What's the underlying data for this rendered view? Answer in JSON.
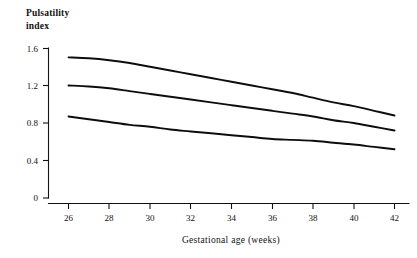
{
  "chart_data": {
    "type": "line",
    "title": "",
    "subtitle": "",
    "xlabel": "Gestational age (weeks)",
    "ylabel": "Pulsatility index",
    "ylabel_line1": "Pulsatility",
    "ylabel_line2": "index",
    "xlim": [
      26,
      42
    ],
    "ylim": [
      0,
      1.6
    ],
    "xticks": [
      26,
      28,
      30,
      32,
      34,
      36,
      38,
      40,
      42
    ],
    "xtick_labels": [
      "26",
      "28",
      "30",
      "32",
      "34",
      "36",
      "38",
      "40",
      "42"
    ],
    "yticks": [
      0,
      0.4,
      0.8,
      1.2,
      1.6
    ],
    "ytick_labels": [
      "0",
      "0.4",
      "0.8",
      "1.2",
      "1.6"
    ],
    "grid": false,
    "legend": "none",
    "x": [
      26,
      27,
      28,
      29,
      30,
      31,
      32,
      33,
      34,
      35,
      36,
      37,
      38,
      39,
      40,
      41,
      42
    ],
    "series": [
      {
        "name": "upper-reference-curve",
        "color": "#0d0d0d",
        "values": [
          1.5,
          1.49,
          1.47,
          1.44,
          1.4,
          1.36,
          1.32,
          1.28,
          1.24,
          1.2,
          1.16,
          1.12,
          1.07,
          1.02,
          0.98,
          0.93,
          0.88
        ]
      },
      {
        "name": "median-reference-curve",
        "color": "#0d0d0d",
        "values": [
          1.2,
          1.19,
          1.17,
          1.14,
          1.11,
          1.08,
          1.05,
          1.02,
          0.99,
          0.96,
          0.93,
          0.9,
          0.87,
          0.83,
          0.8,
          0.76,
          0.72
        ]
      },
      {
        "name": "lower-reference-curve",
        "color": "#0d0d0d",
        "values": [
          0.87,
          0.84,
          0.81,
          0.78,
          0.76,
          0.73,
          0.71,
          0.69,
          0.67,
          0.65,
          0.63,
          0.62,
          0.61,
          0.59,
          0.57,
          0.545,
          0.52
        ]
      }
    ]
  },
  "axes_colors": {
    "axis": "#111111",
    "text": "#111111",
    "background": "#ffffff"
  }
}
